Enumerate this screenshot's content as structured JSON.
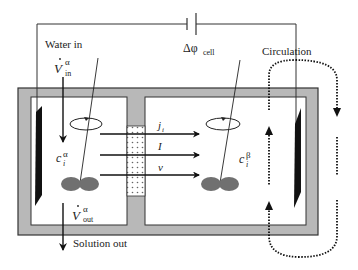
{
  "diagram": {
    "type": "electrodialysis-cell-schematic",
    "labels": {
      "water_in": "Water in",
      "v_in_symbol": "V",
      "v_in_sup": "α",
      "v_in_sub": "in",
      "delta_phi": "Δφ",
      "delta_phi_sub": "cell",
      "circulation": "Circulation",
      "c_alpha_symbol": "c",
      "c_alpha_sub": "i",
      "c_alpha_sup": "α",
      "c_beta_symbol": "c",
      "c_beta_sub": "i",
      "c_beta_sup": "β",
      "v_out_symbol": "V",
      "v_out_sup": "α",
      "v_out_sub": "out",
      "solution_out": "Solution out"
    },
    "fluxes": [
      {
        "label": "j",
        "sub": "i"
      },
      {
        "label": "I",
        "sub": ""
      },
      {
        "label": "v",
        "sub": ""
      }
    ],
    "colors": {
      "wall": "#b8b8b8",
      "wall_border": "#333333",
      "electrode": "#111111",
      "stirrer": "#707070",
      "membrane_dots": "#666666",
      "line": "#111111"
    },
    "components": [
      "left-chamber-alpha",
      "right-chamber-beta",
      "membrane",
      "left-electrode",
      "right-electrode",
      "left-stirrer",
      "right-stirrer",
      "power-source",
      "circulation-loop"
    ]
  }
}
